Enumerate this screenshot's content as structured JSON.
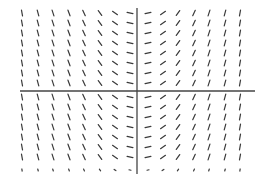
{
  "chart_data": {
    "type": "slope_field",
    "title": "",
    "xlabel": "",
    "ylabel": "",
    "grid": false,
    "legend": null,
    "axes": {
      "x_axis": {
        "y_px": 91,
        "x_start_px": 20,
        "x_end_px": 255,
        "color": "#444444"
      },
      "y_axis": {
        "x_px": 137,
        "y_start_px": 8,
        "y_end_px": 174,
        "color": "#444444"
      }
    },
    "columns_px": [
      22,
      38,
      53,
      69,
      84,
      100,
      115,
      130,
      148,
      163,
      178,
      194,
      209,
      225,
      240
    ],
    "column_angles_deg": [
      -80,
      -75,
      -72,
      -70,
      -65,
      -55,
      -35,
      -12,
      12,
      35,
      55,
      65,
      72,
      75,
      80
    ],
    "rows_px": [
      13,
      23,
      33,
      43,
      53,
      63,
      73,
      83,
      97,
      107,
      117,
      127,
      137,
      147,
      157
    ],
    "clipped_row_px": 172,
    "segment_length_px": 6,
    "segment_color": "#3a3a3a",
    "segment_width_px": 1.2
  }
}
